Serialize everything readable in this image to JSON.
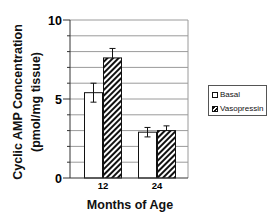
{
  "chart_data": {
    "type": "bar",
    "title": "",
    "xlabel": "Months of Age",
    "ylabel": "Cyclic AMP Concentration (pmol/mg tissue)",
    "ylabel_lines": [
      "Cyclic AMP Concentration",
      "(pmol/mg tissue)"
    ],
    "categories": [
      "12",
      "24"
    ],
    "series": [
      {
        "name": "Basal",
        "values": [
          5.4,
          2.9
        ],
        "errors": [
          0.6,
          0.3
        ],
        "fill": "white"
      },
      {
        "name": "Vasopressin",
        "values": [
          7.6,
          3.0
        ],
        "errors": [
          0.6,
          0.3
        ],
        "fill": "hatched"
      }
    ],
    "ylim": [
      0,
      10
    ],
    "yticks": [
      "0",
      "5",
      "10"
    ],
    "grid": true,
    "legend_position": "right"
  },
  "colors": {
    "bar_stroke": "#111111",
    "grid": "#9a9a9a",
    "axis": "#333333"
  }
}
